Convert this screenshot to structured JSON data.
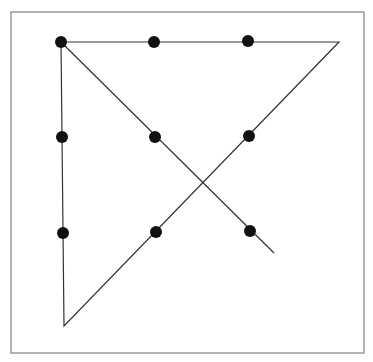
{
  "diagram": {
    "type": "nine-dots-puzzle-solution",
    "frame": {
      "x": 11,
      "y": 12,
      "width": 353,
      "height": 341,
      "stroke": "#808080"
    },
    "dot_color": "#111111",
    "line_color": "#333333",
    "dot_radius": 6,
    "dots": [
      {
        "x": 61,
        "y": 42
      },
      {
        "x": 154,
        "y": 42
      },
      {
        "x": 248,
        "y": 41
      },
      {
        "x": 62,
        "y": 137
      },
      {
        "x": 155,
        "y": 137
      },
      {
        "x": 249,
        "y": 136
      },
      {
        "x": 63,
        "y": 233
      },
      {
        "x": 156,
        "y": 232
      },
      {
        "x": 250,
        "y": 231
      }
    ],
    "path": [
      {
        "x": 274,
        "y": 253
      },
      {
        "x": 61,
        "y": 42
      },
      {
        "x": 339,
        "y": 42
      },
      {
        "x": 64,
        "y": 326
      },
      {
        "x": 61,
        "y": 42
      }
    ]
  }
}
